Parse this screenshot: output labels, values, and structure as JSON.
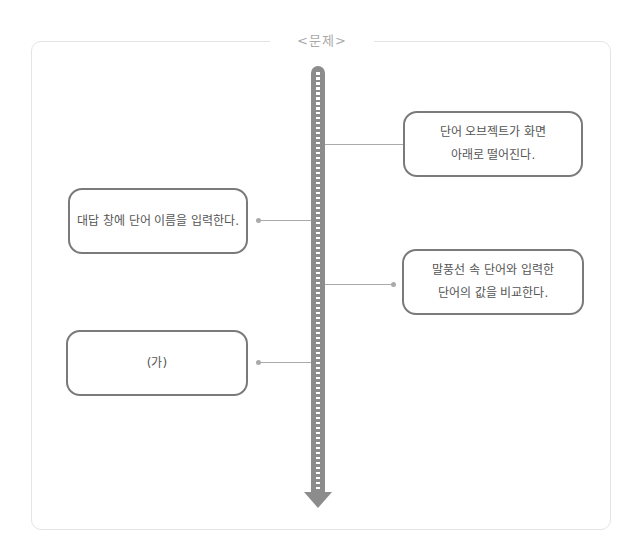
{
  "title": "<문제>",
  "steps": [
    {
      "side": "right",
      "lines": [
        "단어 오브젝트가 화면",
        "아래로 떨어진다."
      ]
    },
    {
      "side": "left",
      "lines": [
        "대답 창에 단어 이름을 입력한다."
      ]
    },
    {
      "side": "right",
      "lines": [
        "말풍선 속 단어와 입력한",
        "단어의 값을 비교한다."
      ]
    },
    {
      "side": "left",
      "lines": [
        "(가)"
      ]
    }
  ],
  "colors": {
    "arrow": "#8c8c8c",
    "box_border": "#7a7a7a",
    "connector": "#aaaaaa",
    "frame_border": "#e4e4e4",
    "title": "#aaaaaa"
  }
}
